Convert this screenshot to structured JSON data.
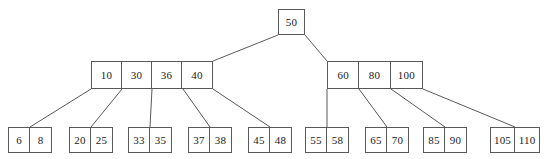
{
  "diagram": {
    "type": "b-plus-tree",
    "style": {
      "line_color": "#58595b",
      "text_color": "#1a1a1a",
      "background": "#ffffff"
    },
    "levels": [
      {
        "name": "root",
        "nodes": [
          {
            "id": "root",
            "keys": [
              "50"
            ],
            "x": 278,
            "y": 9,
            "width": 27,
            "height": 26
          }
        ]
      },
      {
        "name": "internal",
        "nodes": [
          {
            "id": "internal-left",
            "keys": [
              "10",
              "30",
              "36",
              "40"
            ],
            "x": 91,
            "y": 61,
            "width": 122,
            "height": 28
          },
          {
            "id": "internal-right",
            "keys": [
              "60",
              "80",
              "100"
            ],
            "x": 327,
            "y": 61,
            "width": 96,
            "height": 28
          }
        ]
      },
      {
        "name": "leaves",
        "nodes": [
          {
            "id": "leaf-1",
            "keys": [
              "6",
              "8"
            ],
            "x": 8,
            "y": 127,
            "width": 44,
            "height": 26
          },
          {
            "id": "leaf-2",
            "keys": [
              "20",
              "25"
            ],
            "x": 69,
            "y": 127,
            "width": 44,
            "height": 26
          },
          {
            "id": "leaf-3",
            "keys": [
              "33",
              "35"
            ],
            "x": 128,
            "y": 127,
            "width": 44,
            "height": 26
          },
          {
            "id": "leaf-4",
            "keys": [
              "37",
              "38"
            ],
            "x": 188,
            "y": 127,
            "width": 44,
            "height": 26
          },
          {
            "id": "leaf-5",
            "keys": [
              "45",
              "48"
            ],
            "x": 248,
            "y": 127,
            "width": 44,
            "height": 26
          },
          {
            "id": "leaf-6",
            "keys": [
              "55",
              "58"
            ],
            "x": 305,
            "y": 127,
            "width": 44,
            "height": 26
          },
          {
            "id": "leaf-7",
            "keys": [
              "65",
              "70"
            ],
            "x": 365,
            "y": 127,
            "width": 44,
            "height": 26
          },
          {
            "id": "leaf-8",
            "keys": [
              "85",
              "90"
            ],
            "x": 423,
            "y": 127,
            "width": 44,
            "height": 26
          },
          {
            "id": "leaf-9",
            "keys": [
              "105",
              "110"
            ],
            "x": 490,
            "y": 127,
            "width": 50,
            "height": 26
          }
        ]
      }
    ],
    "edges": [
      {
        "from": "root",
        "to": "internal-left",
        "x1": 278,
        "y1": 35,
        "x2": 213,
        "y2": 61
      },
      {
        "from": "root",
        "to": "internal-right",
        "x1": 305,
        "y1": 35,
        "x2": 327,
        "y2": 61
      },
      {
        "from": "internal-left",
        "to": "leaf-1",
        "x1": 91,
        "y1": 89,
        "x2": 30,
        "y2": 127
      },
      {
        "from": "internal-left",
        "to": "leaf-2",
        "x1": 122,
        "y1": 89,
        "x2": 91,
        "y2": 127
      },
      {
        "from": "internal-left",
        "to": "leaf-3",
        "x1": 152,
        "y1": 89,
        "x2": 150,
        "y2": 127
      },
      {
        "from": "internal-left",
        "to": "leaf-4",
        "x1": 183,
        "y1": 89,
        "x2": 210,
        "y2": 127
      },
      {
        "from": "internal-left",
        "to": "leaf-5",
        "x1": 213,
        "y1": 89,
        "x2": 270,
        "y2": 127
      },
      {
        "from": "internal-right",
        "to": "leaf-6",
        "x1": 327,
        "y1": 89,
        "x2": 327,
        "y2": 127
      },
      {
        "from": "internal-right",
        "to": "leaf-7",
        "x1": 359,
        "y1": 89,
        "x2": 387,
        "y2": 127
      },
      {
        "from": "internal-right",
        "to": "leaf-8",
        "x1": 391,
        "y1": 89,
        "x2": 445,
        "y2": 127
      },
      {
        "from": "internal-right",
        "to": "leaf-9",
        "x1": 423,
        "y1": 89,
        "x2": 515,
        "y2": 127
      }
    ]
  }
}
